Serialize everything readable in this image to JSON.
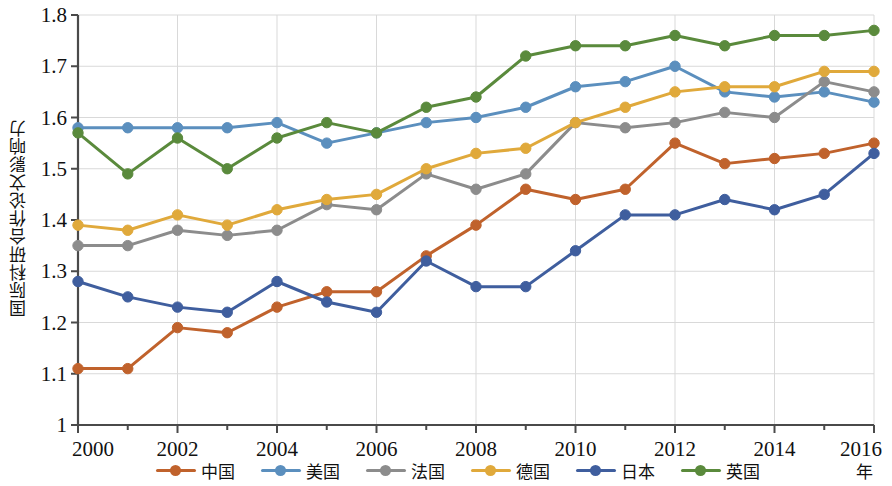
{
  "chart_data": {
    "type": "line",
    "title": "",
    "xlabel": "年",
    "ylabel": "国际科研合作论文影响力",
    "x": [
      2000,
      2001,
      2002,
      2003,
      2004,
      2005,
      2006,
      2007,
      2008,
      2009,
      2010,
      2011,
      2012,
      2013,
      2014,
      2015,
      2016
    ],
    "xlim": [
      2000,
      2016
    ],
    "ylim": [
      1.0,
      1.8
    ],
    "x_ticks": [
      "2000",
      "2002",
      "2004",
      "2006",
      "2008",
      "2010",
      "2012",
      "2014",
      "2016"
    ],
    "y_ticks": [
      "1",
      "1.1",
      "1.2",
      "1.3",
      "1.4",
      "1.5",
      "1.6",
      "1.7",
      "1.8"
    ],
    "grid": true,
    "legend_position": "bottom",
    "series": [
      {
        "name": "中国",
        "color": "#C0622C",
        "values": [
          1.11,
          1.11,
          1.19,
          1.18,
          1.23,
          1.26,
          1.26,
          1.33,
          1.39,
          1.46,
          1.44,
          1.46,
          1.55,
          1.51,
          1.52,
          1.53,
          1.55
        ]
      },
      {
        "name": "美国",
        "color": "#5B8FBE",
        "values": [
          1.58,
          1.58,
          1.58,
          1.58,
          1.59,
          1.55,
          1.57,
          1.59,
          1.6,
          1.62,
          1.66,
          1.67,
          1.7,
          1.65,
          1.64,
          1.65,
          1.63
        ]
      },
      {
        "name": "法国",
        "color": "#8C8C8C",
        "values": [
          1.35,
          1.35,
          1.38,
          1.37,
          1.38,
          1.43,
          1.42,
          1.49,
          1.46,
          1.49,
          1.59,
          1.58,
          1.59,
          1.61,
          1.6,
          1.67,
          1.65
        ]
      },
      {
        "name": "德国",
        "color": "#E0A93B",
        "values": [
          1.39,
          1.38,
          1.41,
          1.39,
          1.42,
          1.44,
          1.45,
          1.5,
          1.53,
          1.54,
          1.59,
          1.62,
          1.65,
          1.66,
          1.66,
          1.69,
          1.69
        ]
      },
      {
        "name": "日本",
        "color": "#3F5E9E",
        "values": [
          1.28,
          1.25,
          1.23,
          1.22,
          1.28,
          1.24,
          1.22,
          1.32,
          1.27,
          1.27,
          1.34,
          1.41,
          1.41,
          1.44,
          1.42,
          1.45,
          1.53
        ]
      },
      {
        "name": "英国",
        "color": "#5A8A3C",
        "values": [
          1.57,
          1.49,
          1.56,
          1.5,
          1.56,
          1.59,
          1.57,
          1.62,
          1.64,
          1.72,
          1.74,
          1.74,
          1.76,
          1.74,
          1.76,
          1.76,
          1.77
        ]
      }
    ]
  }
}
